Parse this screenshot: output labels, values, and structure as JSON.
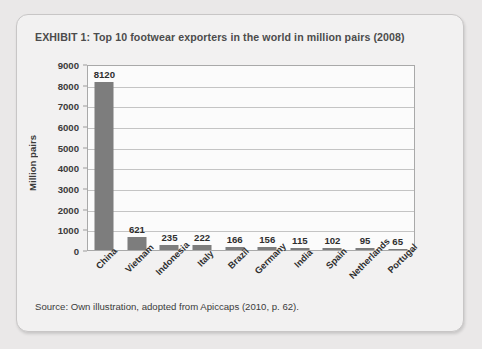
{
  "exhibit": {
    "title": "EXHIBIT 1:  Top 10 footwear exporters in the world in million pairs (2008)",
    "source": "Source: Own illustration, adopted from Apiccaps (2010, p. 62)."
  },
  "chart_data": {
    "type": "bar",
    "title": "Top 10 footwear exporters in the world in million pairs (2008)",
    "xlabel": "",
    "ylabel": "Million pairs",
    "categories": [
      "China",
      "Vietnam",
      "Indonesia",
      "Italy",
      "Brazil",
      "Germany",
      "India",
      "Spain",
      "Netherlands",
      "Portugal"
    ],
    "values": [
      8120,
      621,
      235,
      222,
      166,
      156,
      115,
      102,
      95,
      65
    ],
    "value_labels": [
      "8120",
      "621",
      "235",
      "222",
      "166",
      "156",
      "115",
      "102",
      "95",
      "65"
    ],
    "ylim": [
      0,
      9000
    ],
    "ytick_values": [
      9000,
      8000,
      7000,
      6000,
      5000,
      4000,
      3000,
      2000,
      1000,
      0
    ],
    "ytick_labels": [
      "9000",
      "8000",
      "7000",
      "6000",
      "5000",
      "4000",
      "3000",
      "2000",
      "1000",
      "0"
    ],
    "grid": true,
    "legend": false,
    "bar_color": "#7d7d7d",
    "plot_background": "#fbfbfb"
  },
  "theme": {
    "page_background": "#eae8e8",
    "card_background": "#f2f1f1",
    "border_color": "#c8c6c6",
    "text_color": "#3b3b3b"
  }
}
